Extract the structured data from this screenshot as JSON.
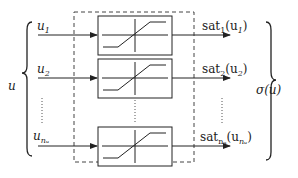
{
  "diagram": {
    "input_vector": "u",
    "output_vector": "σ(u)",
    "inputs": [
      {
        "name": "u",
        "sub": "1"
      },
      {
        "name": "u",
        "sub": "2"
      },
      {
        "name": "u",
        "sub": "nᵤ"
      }
    ],
    "outputs": [
      {
        "func": "sat",
        "sub": "1",
        "arg": "(u",
        "argsub": "1",
        "close": ")"
      },
      {
        "func": "sat",
        "sub": "2",
        "arg": "(u",
        "argsub": "2",
        "close": ")"
      },
      {
        "func": "sat",
        "sub": "nᵤ",
        "arg": "(u",
        "argsub": "nᵤ",
        "close": ")"
      }
    ],
    "block_type": "saturation",
    "ellipsis": "vertical-dots"
  }
}
